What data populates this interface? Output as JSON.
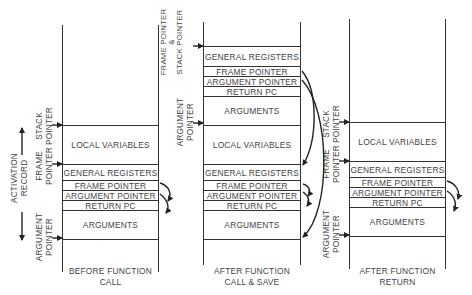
{
  "diagram": {
    "columns": [
      {
        "caption_line1": "BEFORE FUNCTION",
        "caption_line2": "CALL",
        "cells": [
          "LOCAL VARIABLES",
          "GENERAL REGISTERS",
          "FRAME POINTER",
          "ARGUMENT POINTER",
          "RETURN PC",
          "ARGUMENTS"
        ],
        "pointers": {
          "stack_pointer": [
            "STACK",
            "POINTER"
          ],
          "frame_pointer": [
            "FRAME",
            "POINTER"
          ],
          "argument_pointer": [
            "ARGUMENT",
            "POINTER"
          ]
        },
        "activation_record": [
          "ACTIVATION",
          "RECORD"
        ]
      },
      {
        "caption_line1": "AFTER FUNCTION",
        "caption_line2": "CALL & SAVE",
        "cells_top": [
          "GENERAL REGISTERS",
          "FRAME POINTER",
          "ARGUMENT POINTER",
          "RETURN PC",
          "ARGUMENTS"
        ],
        "cells": [
          "LOCAL VARIABLES",
          "GENERAL REGISTERS",
          "FRAME POINTER",
          "ARGUMENT POINTER",
          "RETURN PC",
          "ARGUMENTS"
        ],
        "pointers": {
          "frame_and_stack_pointer": [
            "FRAME POINTER",
            "&",
            "STACK POINTER"
          ],
          "argument_pointer": [
            "ARGUMENT",
            "POINTER"
          ]
        }
      },
      {
        "caption_line1": "AFTER FUNCTION",
        "caption_line2": "RETURN",
        "cells": [
          "LOCAL VARIABLES",
          "GENERAL REGISTERS",
          "FRAME POINTER",
          "ARGUMENT POINTER",
          "RETURN PC",
          "ARGUMENTS"
        ],
        "pointers": {
          "stack_pointer": [
            "STACK",
            "POINTER"
          ],
          "frame_pointer": [
            "FRAME",
            "POINTER"
          ],
          "argument_pointer": [
            "ARGUMENT",
            "POINTER"
          ]
        }
      }
    ],
    "colors": {
      "line": "#333333",
      "text": "#444444",
      "background": "#ffffff"
    }
  }
}
